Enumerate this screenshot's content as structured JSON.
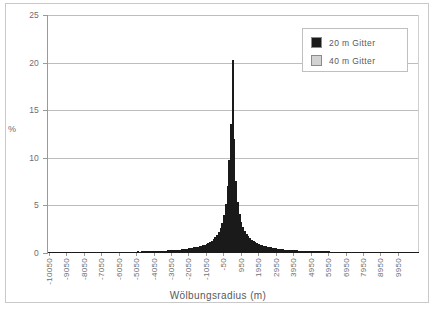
{
  "chart_data": {
    "type": "bar",
    "title": "",
    "subtitle": "",
    "xlabel": "Wölbungsradius  (m)",
    "ylabel": "%",
    "ylim": [
      0,
      25
    ],
    "ytick_values": [
      0,
      5,
      10,
      15,
      20,
      25
    ],
    "ytick_labels": [
      "0",
      "5",
      "10",
      "15",
      "20",
      "25"
    ],
    "grid": "horizontal",
    "legend_position": "top-right",
    "xlim": [
      -10550,
      10450
    ],
    "bin_width": 100,
    "xtick_labels": [
      "-10050",
      "-9050",
      "-8050",
      "-7050",
      "-6050",
      "-5050",
      "-4050",
      "-3050",
      "-2050",
      "-1050",
      "-50",
      "950",
      "1950",
      "2950",
      "3950",
      "4950",
      "5950",
      "6950",
      "7950",
      "8950",
      "9950"
    ],
    "series": [
      {
        "name": "20 m Gitter",
        "color": "#1a1a1a",
        "categories": [
          -10500,
          -10400,
          -10300,
          -10200,
          -10100,
          -10000,
          -9900,
          -9800,
          -9700,
          -9600,
          -9500,
          -9400,
          -9300,
          -9200,
          -9100,
          -9000,
          -8900,
          -8800,
          -8700,
          -8600,
          -8500,
          -8400,
          -8300,
          -8200,
          -8100,
          -8000,
          -7900,
          -7800,
          -7700,
          -7600,
          -7500,
          -7400,
          -7300,
          -7200,
          -7100,
          -7000,
          -6900,
          -6800,
          -6700,
          -6600,
          -6500,
          -6400,
          -6300,
          -6200,
          -6100,
          -6000,
          -5900,
          -5800,
          -5700,
          -5600,
          -5500,
          -5400,
          -5300,
          -5200,
          -5100,
          -5000,
          -4900,
          -4800,
          -4700,
          -4600,
          -4500,
          -4400,
          -4300,
          -4200,
          -4100,
          -4000,
          -3900,
          -3800,
          -3700,
          -3600,
          -3500,
          -3400,
          -3300,
          -3200,
          -3100,
          -3000,
          -2900,
          -2800,
          -2700,
          -2600,
          -2500,
          -2400,
          -2300,
          -2200,
          -2100,
          -2000,
          -1900,
          -1800,
          -1700,
          -1600,
          -1500,
          -1400,
          -1300,
          -1200,
          -1100,
          -1000,
          -900,
          -800,
          -700,
          -600,
          -500,
          -400,
          -300,
          -200,
          -100,
          0,
          100,
          200,
          300,
          400,
          500,
          600,
          700,
          800,
          900,
          1000,
          1100,
          1200,
          1300,
          1400,
          1500,
          1600,
          1700,
          1800,
          1900,
          2000,
          2100,
          2200,
          2300,
          2400,
          2500,
          2600,
          2700,
          2800,
          2900,
          3000,
          3100,
          3200,
          3300,
          3400,
          3500,
          3600,
          3700,
          3800,
          3900,
          4000,
          4100,
          4200,
          4300,
          4400,
          4500,
          4600,
          4700,
          4800,
          4900,
          5000,
          5100,
          5200,
          5300,
          5400,
          5500,
          5600,
          5700,
          5800,
          5900,
          6000,
          6100,
          6200,
          6300,
          6400,
          6500,
          6600,
          6700,
          6800,
          6900,
          7000,
          7100,
          7200,
          7300,
          7400,
          7500,
          7600,
          7700,
          7800,
          7900,
          8000,
          8100,
          8200,
          8300,
          8400,
          8500,
          8600,
          8700,
          8800,
          8900,
          9000,
          9100,
          9200,
          9300,
          9400,
          9500,
          9600,
          9700,
          9800,
          9900,
          10000,
          10100,
          10200,
          10300,
          10400
        ],
        "values": [
          0.1,
          0.1,
          0.1,
          0.1,
          0.1,
          0.1,
          0.1,
          0.1,
          0.1,
          0.1,
          0.1,
          0.1,
          0.1,
          0.1,
          0.1,
          0.1,
          0.1,
          0.1,
          0.1,
          0.1,
          0.1,
          0.1,
          0.1,
          0.1,
          0.1,
          0.1,
          0.12,
          0.1,
          0.1,
          0.12,
          0.1,
          0.12,
          0.1,
          0.12,
          0.12,
          0.12,
          0.12,
          0.12,
          0.12,
          0.12,
          0.12,
          0.12,
          0.15,
          0.12,
          0.15,
          0.15,
          0.15,
          0.15,
          0.15,
          0.15,
          0.15,
          0.18,
          0.15,
          0.18,
          0.18,
          0.18,
          0.18,
          0.2,
          0.2,
          0.2,
          0.2,
          0.2,
          0.22,
          0.22,
          0.22,
          0.25,
          0.25,
          0.25,
          0.28,
          0.28,
          0.3,
          0.3,
          0.32,
          0.32,
          0.35,
          0.35,
          0.38,
          0.4,
          0.42,
          0.45,
          0.48,
          0.5,
          0.55,
          0.58,
          0.62,
          0.65,
          0.7,
          0.75,
          0.82,
          0.88,
          0.95,
          1.05,
          1.15,
          1.3,
          1.45,
          1.65,
          1.9,
          2.2,
          2.6,
          3.2,
          4.0,
          5.2,
          7.0,
          9.8,
          13.6,
          20.3,
          12.0,
          7.6,
          5.4,
          4.1,
          3.3,
          2.7,
          2.3,
          2.0,
          1.75,
          1.55,
          1.4,
          1.25,
          1.15,
          1.05,
          0.95,
          0.88,
          0.82,
          0.75,
          0.7,
          0.65,
          0.6,
          0.58,
          0.55,
          0.5,
          0.48,
          0.45,
          0.42,
          0.4,
          0.38,
          0.36,
          0.35,
          0.33,
          0.32,
          0.3,
          0.29,
          0.28,
          0.27,
          0.26,
          0.25,
          0.24,
          0.23,
          0.22,
          0.22,
          0.21,
          0.2,
          0.2,
          0.19,
          0.19,
          0.18,
          0.18,
          0.17,
          0.17,
          0.16,
          0.16,
          0.16,
          0.15,
          0.15,
          0.15,
          0.14,
          0.14,
          0.14,
          0.13,
          0.13,
          0.13,
          0.13,
          0.12,
          0.12,
          0.12,
          0.12,
          0.12,
          0.11,
          0.11,
          0.11,
          0.11,
          0.11,
          0.1,
          0.1,
          0.1,
          0.1,
          0.1,
          0.1,
          0.1,
          0.1,
          0.1,
          0.1,
          0.1,
          0.1,
          0.1,
          0.1,
          0.1,
          0.1,
          0.1,
          0.1,
          0.1,
          0.1,
          0.1,
          0.1,
          0.1,
          0.1,
          0.1,
          0.1,
          0.1,
          0.1,
          0.1,
          0.1,
          0.1
        ]
      },
      {
        "name": "40 m Gitter",
        "color": "#d2d2d2",
        "categories": [],
        "values": []
      }
    ]
  },
  "legend": {
    "items": [
      {
        "label": "20 m Gitter",
        "color": "#1a1a1a"
      },
      {
        "label": "40 m Gitter",
        "color": "#d2d2d2"
      }
    ]
  },
  "axes": {
    "ylabel": "%",
    "xlabel": "Wölbungsradius  (m)"
  }
}
